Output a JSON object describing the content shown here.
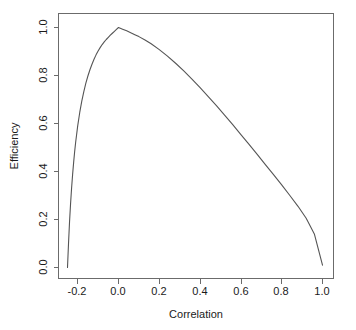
{
  "chart_data": {
    "type": "line",
    "title": "",
    "xlabel": "Correlation",
    "ylabel": "Efficiency",
    "xlim": [
      -0.28,
      1.04
    ],
    "ylim": [
      -0.03,
      1.04
    ],
    "grid": false,
    "legend": null,
    "xticks": [
      -0.2,
      0.0,
      0.2,
      0.4,
      0.6,
      0.8,
      1.0
    ],
    "xticklabels": [
      "-0.2",
      "0.0",
      "0.2",
      "0.4",
      "0.6",
      "0.8",
      "1.0"
    ],
    "yticks": [
      0.0,
      0.2,
      0.4,
      0.6,
      0.8,
      1.0
    ],
    "yticklabels": [
      "0.0",
      "0.2",
      "0.4",
      "0.6",
      "0.8",
      "1.0"
    ],
    "series": [
      {
        "name": "efficiency",
        "color": "#555555",
        "x": [
          -0.25,
          -0.245,
          -0.24,
          -0.235,
          -0.23,
          -0.225,
          -0.22,
          -0.215,
          -0.21,
          -0.2,
          -0.19,
          -0.18,
          -0.17,
          -0.16,
          -0.15,
          -0.14,
          -0.13,
          -0.12,
          -0.11,
          -0.1,
          -0.09,
          -0.08,
          -0.07,
          -0.06,
          -0.05,
          -0.04,
          -0.03,
          -0.02,
          -0.01,
          0.0,
          0.02,
          0.04,
          0.06,
          0.08,
          0.1,
          0.13,
          0.16,
          0.2,
          0.24,
          0.28,
          0.32,
          0.36,
          0.4,
          0.44,
          0.48,
          0.52,
          0.56,
          0.6,
          0.64,
          0.68,
          0.72,
          0.76,
          0.8,
          0.84,
          0.88,
          0.92,
          0.96,
          1.0
        ],
        "y": [
          0.0,
          0.1,
          0.19,
          0.265,
          0.33,
          0.387,
          0.437,
          0.482,
          0.522,
          0.59,
          0.646,
          0.693,
          0.733,
          0.768,
          0.798,
          0.824,
          0.847,
          0.868,
          0.886,
          0.902,
          0.916,
          0.929,
          0.94,
          0.95,
          0.959,
          0.968,
          0.976,
          0.984,
          0.992,
          1.0,
          0.993,
          0.986,
          0.978,
          0.97,
          0.962,
          0.948,
          0.932,
          0.908,
          0.881,
          0.851,
          0.819,
          0.785,
          0.749,
          0.712,
          0.674,
          0.635,
          0.595,
          0.554,
          0.513,
          0.471,
          0.429,
          0.387,
          0.344,
          0.3,
          0.255,
          0.205,
          0.14,
          0.01
        ]
      }
    ]
  },
  "axes": {
    "x_title": "Correlation",
    "y_title": "Efficiency"
  }
}
